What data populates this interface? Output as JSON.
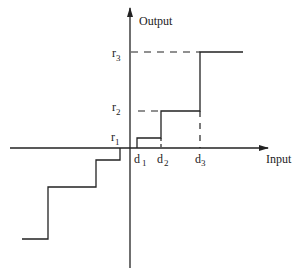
{
  "diagram": {
    "type": "quantizer-staircase",
    "axes": {
      "x_label": "Input",
      "y_label": "Output"
    },
    "levels": [
      {
        "name": "r",
        "sub": "1"
      },
      {
        "name": "r",
        "sub": "2"
      },
      {
        "name": "r",
        "sub": "3"
      }
    ],
    "thresholds": [
      {
        "name": "d",
        "sub": "1"
      },
      {
        "name": "d",
        "sub": "2"
      },
      {
        "name": "d",
        "sub": "3"
      }
    ],
    "colors": {
      "line": "#222222",
      "background": "#ffffff"
    }
  }
}
